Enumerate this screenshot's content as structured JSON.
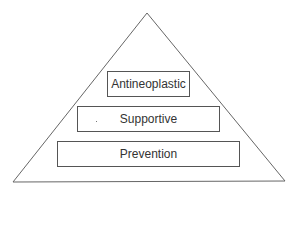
{
  "diagram": {
    "type": "pyramid",
    "levels": [
      {
        "label": "Antineoplastic"
      },
      {
        "label": "Supportive"
      },
      {
        "label": "Prevention"
      }
    ],
    "colors": {
      "stroke": "#555555",
      "text": "#333333",
      "background": "#ffffff"
    }
  }
}
